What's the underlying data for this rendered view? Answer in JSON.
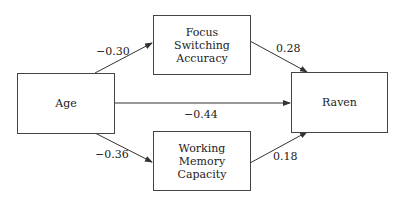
{
  "diagram": {
    "nodes": {
      "age": {
        "label": "Age"
      },
      "focus": {
        "line1": "Focus",
        "line2": "Switching",
        "line3": "Accuracy"
      },
      "raven": {
        "label": "Raven"
      },
      "wm": {
        "line1": "Working",
        "line2": "Memory",
        "line3": "Capacity"
      }
    },
    "edges": {
      "age_focus": "−0.30",
      "focus_raven": "0.28",
      "age_raven": "−0.44",
      "age_wm": "−0.36",
      "wm_raven": "0.18"
    }
  }
}
